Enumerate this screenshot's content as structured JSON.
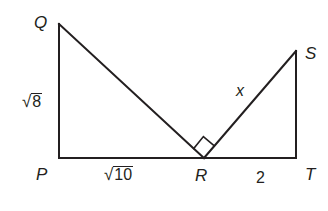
{
  "diagram": {
    "type": "geometry-figure",
    "stroke_color": "#231f20",
    "points": {
      "Q": {
        "label": "Q",
        "x": 59,
        "y": 24
      },
      "P": {
        "label": "P",
        "x": 59,
        "y": 158
      },
      "R": {
        "label": "R",
        "x": 204,
        "y": 158
      },
      "S": {
        "label": "S",
        "x": 296,
        "y": 51
      },
      "T": {
        "label": "T",
        "x": 296,
        "y": 158
      }
    },
    "segments": [
      {
        "from": "Q",
        "to": "P",
        "label": "√8"
      },
      {
        "from": "P",
        "to": "R",
        "label": "√10"
      },
      {
        "from": "Q",
        "to": "R",
        "label": ""
      },
      {
        "from": "R",
        "to": "S",
        "label": "x"
      },
      {
        "from": "R",
        "to": "T",
        "label": "2"
      },
      {
        "from": "S",
        "to": "T",
        "label": ""
      }
    ],
    "right_angle_marker": {
      "at": "R",
      "between": [
        "Q",
        "S"
      ]
    },
    "labels": {
      "Q": "Q",
      "P": "P",
      "R": "R",
      "S": "S",
      "T": "T",
      "QP_radical_symbol": "√",
      "QP_radicand": "8",
      "PR_radical_symbol": "√",
      "PR_radicand": "10",
      "RS": "x",
      "RT": "2"
    }
  }
}
